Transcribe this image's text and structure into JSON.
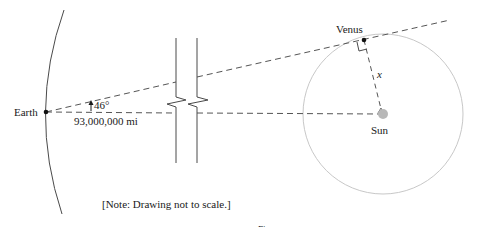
{
  "diagram": {
    "labels": {
      "earth": "Earth",
      "venus": "Venus",
      "sun": "Sun",
      "angle": "46°",
      "distance": "93,000,000 mi",
      "x_variable": "x",
      "note": "[Note: Drawing not to scale.]",
      "caption_partial": "Figure"
    },
    "values": {
      "angle_degrees": 46,
      "earth_sun_distance_mi": 93000000
    },
    "colors": {
      "line": "#4a4a4a",
      "dash": "#555555",
      "orbit": "#c8c8c8",
      "sun_fill": "#b8b8b8",
      "text": "#1a1a1a"
    }
  }
}
